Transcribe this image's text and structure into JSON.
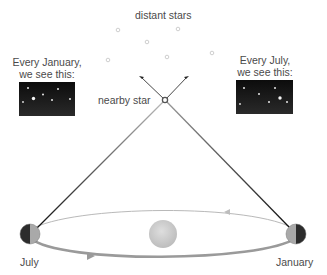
{
  "labels": {
    "distant_stars": "distant stars",
    "nearby_star": "nearby star",
    "january_caption_line1": "Every January,",
    "january_caption_line2": "we see this:",
    "july_caption_line1": "Every July,",
    "july_caption_line2": "we see this:",
    "earth_july": "July",
    "earth_january": "January"
  },
  "diagram": {
    "type": "stellar-parallax",
    "distant_stars": [
      {
        "x": 118,
        "y": 30
      },
      {
        "x": 178,
        "y": 29
      },
      {
        "x": 147,
        "y": 42
      },
      {
        "x": 108,
        "y": 60
      },
      {
        "x": 167,
        "y": 57
      },
      {
        "x": 212,
        "y": 53
      }
    ],
    "nearby_star": {
      "x": 165,
      "y": 100
    },
    "sun": {
      "x": 163,
      "y": 234,
      "r": 14
    },
    "orbit": {
      "cx": 163,
      "cy": 232,
      "rx": 133,
      "ry": 22
    },
    "earth_positions": [
      {
        "name": "July",
        "x": 30,
        "y": 234
      },
      {
        "name": "January",
        "x": 296,
        "y": 234
      }
    ],
    "sky_views": [
      {
        "name": "January",
        "stars": [
          [
            9,
            5
          ],
          [
            24,
            13
          ],
          [
            39,
            6
          ],
          [
            4,
            18
          ],
          [
            15,
            16
          ],
          [
            33,
            18
          ],
          [
            50,
            17
          ]
        ]
      },
      {
        "name": "July",
        "stars": [
          [
            8,
            6
          ],
          [
            24,
            13
          ],
          [
            40,
            6
          ],
          [
            4,
            18
          ],
          [
            33,
            17
          ],
          [
            44,
            14
          ],
          [
            51,
            17
          ]
        ]
      }
    ],
    "colors": {
      "sky_box": "#151515",
      "sight_line": "#222222",
      "orbit": "#a8a8a8",
      "sun": "#cfcfcf",
      "text": "#4a4a4a"
    }
  }
}
